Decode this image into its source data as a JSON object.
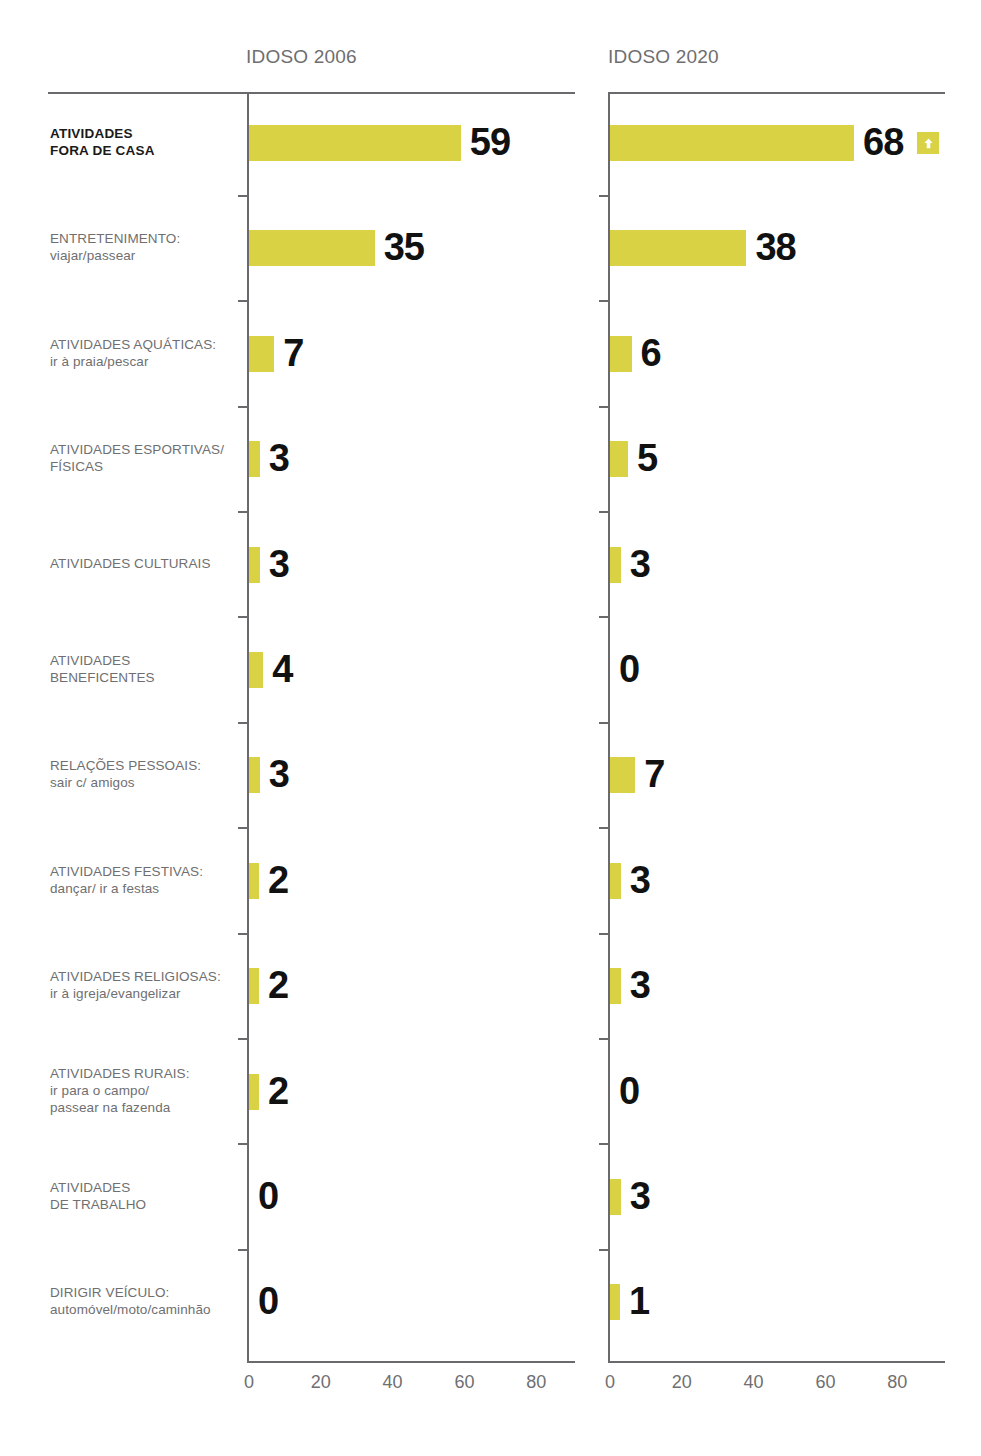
{
  "panels": [
    {
      "id": "idoso-2006",
      "title": "IDOSO 2006"
    },
    {
      "id": "idoso-2020",
      "title": "IDOSO 2020"
    }
  ],
  "axis": {
    "ticks": [
      "0",
      "20",
      "40",
      "60",
      "80"
    ],
    "min": 0,
    "max": 90
  },
  "rows": [
    {
      "line1": "ATIVIDADES",
      "line2": "FORA DE CASA",
      "emphasis": true,
      "v2006": "59",
      "v2020": "68",
      "trend": "arrow-up-icon"
    },
    {
      "line1": "ENTRETENIMENTO:",
      "line2": "viajar/passear",
      "emphasis": false,
      "v2006": "35",
      "v2020": "38",
      "trend": ""
    },
    {
      "line1": "ATIVIDADES AQUÁTICAS:",
      "line2": "ir à praia/pescar",
      "emphasis": false,
      "v2006": "7",
      "v2020": "6",
      "trend": ""
    },
    {
      "line1": "ATIVIDADES ESPORTIVAS/",
      "line2": "FÍSICAS",
      "emphasis": false,
      "v2006": "3",
      "v2020": "5",
      "trend": ""
    },
    {
      "line1": "ATIVIDADES CULTURAIS",
      "line2": "",
      "emphasis": false,
      "v2006": "3",
      "v2020": "3",
      "trend": ""
    },
    {
      "line1": "ATIVIDADES",
      "line2": "BENEFICENTES",
      "emphasis": false,
      "v2006": "4",
      "v2020": "0",
      "trend": ""
    },
    {
      "line1": "RELAÇÕES PESSOAIS:",
      "line2": "sair c/ amigos",
      "emphasis": false,
      "v2006": "3",
      "v2020": "7",
      "trend": ""
    },
    {
      "line1": "ATIVIDADES FESTIVAS:",
      "line2": "dançar/ ir a festas",
      "emphasis": false,
      "v2006": "2",
      "v2020": "3",
      "trend": ""
    },
    {
      "line1": "ATIVIDADES RELIGIOSAS:",
      "line2": "ir à igreja/evangelizar",
      "emphasis": false,
      "v2006": "2",
      "v2020": "3",
      "trend": ""
    },
    {
      "line1": "ATIVIDADES RURAIS:",
      "line2": "ir para o campo/",
      "line3": "passear na fazenda",
      "emphasis": false,
      "v2006": "2",
      "v2020": "0",
      "trend": ""
    },
    {
      "line1": "ATIVIDADES",
      "line2": "DE TRABALHO",
      "emphasis": false,
      "v2006": "0",
      "v2020": "3",
      "trend": ""
    },
    {
      "line1": "DIRIGIR VEÍCULO:",
      "line2": "automóvel/moto/caminhão",
      "emphasis": false,
      "v2006": "0",
      "v2020": "1",
      "trend": ""
    }
  ],
  "colors": {
    "bar": "#d9d244",
    "axis": "#6a6a6c",
    "label": "#6f6f71",
    "value": "#111111"
  },
  "chart_data": {
    "type": "bar",
    "title": "",
    "orientation": "horizontal",
    "panels": [
      "IDOSO 2006",
      "IDOSO 2020"
    ],
    "categories": [
      "ATIVIDADES FORA DE CASA",
      "ENTRETENIMENTO: viajar/passear",
      "ATIVIDADES AQUÁTICAS: ir à praia/pescar",
      "ATIVIDADES ESPORTIVAS/FÍSICAS",
      "ATIVIDADES CULTURAIS",
      "ATIVIDADES BENEFICENTES",
      "RELAÇÕES PESSOAIS: sair c/ amigos",
      "ATIVIDADES FESTIVAS: dançar/ ir a festas",
      "ATIVIDADES RELIGIOSAS: ir à igreja/evangelizar",
      "ATIVIDADES RURAIS: ir para o campo/passear na fazenda",
      "ATIVIDADES DE TRABALHO",
      "DIRIGIR VEÍCULO: automóvel/moto/caminhão"
    ],
    "series": [
      {
        "name": "IDOSO 2006",
        "values": [
          59,
          35,
          7,
          3,
          3,
          4,
          3,
          2,
          2,
          2,
          0,
          0
        ]
      },
      {
        "name": "IDOSO 2020",
        "values": [
          68,
          38,
          6,
          5,
          3,
          0,
          7,
          3,
          3,
          0,
          3,
          1
        ]
      }
    ],
    "xlabel": "",
    "ylabel": "",
    "xlim": [
      0,
      90
    ],
    "xticks": [
      0,
      20,
      40,
      60,
      80
    ],
    "grid": false,
    "legend": "none",
    "annotations": [
      {
        "category": "ATIVIDADES FORA DE CASA",
        "panel": "IDOSO 2020",
        "marker": "arrow-up-icon"
      }
    ],
    "bar_color": "#d9d244"
  }
}
